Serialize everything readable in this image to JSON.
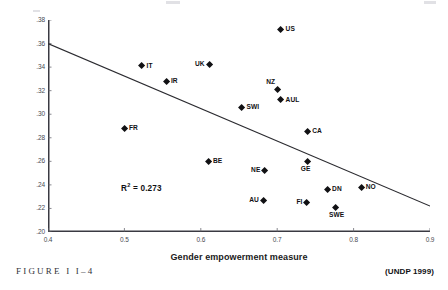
{
  "figure": {
    "caption": "FIGURE I I–4",
    "source_credit": "(UNDP 1999)"
  },
  "chart_data": {
    "type": "scatter",
    "title": "",
    "xlabel": "Gender empowerment measure",
    "ylabel": "Disposable income Gini",
    "xlim": [
      0.4,
      0.9
    ],
    "ylim": [
      0.2,
      0.38
    ],
    "xticks": [
      "0.4",
      "0.5",
      "0.6",
      "0.7",
      "0.8",
      "0.9"
    ],
    "xtick_values": [
      0.4,
      0.5,
      0.6,
      0.7,
      0.8,
      0.9
    ],
    "yticks": [
      ".38",
      ".36",
      ".34",
      ".32",
      ".30",
      ".28",
      ".26",
      ".24",
      ".22",
      ".20"
    ],
    "ytick_values": [
      0.38,
      0.36,
      0.34,
      0.32,
      0.3,
      0.28,
      0.26,
      0.24,
      0.22,
      0.2
    ],
    "grid": false,
    "legend": "none",
    "annotations": [
      {
        "text": "R² = 0.273",
        "r_squared": 0.273
      }
    ],
    "trendline": {
      "type": "linear",
      "x0": 0.4,
      "y0": 0.36,
      "x1": 0.9,
      "y1": 0.222,
      "color": "#2b2b30"
    },
    "points": [
      {
        "label": "US",
        "x": 0.705,
        "y": 0.372,
        "label_pos": "right"
      },
      {
        "label": "IT",
        "x": 0.523,
        "y": 0.341,
        "label_pos": "right"
      },
      {
        "label": "UK",
        "x": 0.611,
        "y": 0.342,
        "label_pos": "left"
      },
      {
        "label": "IR",
        "x": 0.555,
        "y": 0.328,
        "label_pos": "right"
      },
      {
        "label": "NZ",
        "x": 0.7,
        "y": 0.321,
        "label_pos": "ne"
      },
      {
        "label": "AUL",
        "x": 0.705,
        "y": 0.312,
        "label_pos": "right"
      },
      {
        "label": "SWI",
        "x": 0.654,
        "y": 0.306,
        "label_pos": "right"
      },
      {
        "label": "FR",
        "x": 0.5,
        "y": 0.288,
        "label_pos": "right"
      },
      {
        "label": "CA",
        "x": 0.74,
        "y": 0.285,
        "label_pos": "right"
      },
      {
        "label": "BE",
        "x": 0.61,
        "y": 0.26,
        "label_pos": "right"
      },
      {
        "label": "GE",
        "x": 0.74,
        "y": 0.26,
        "label_pos": "below"
      },
      {
        "label": "NE",
        "x": 0.684,
        "y": 0.252,
        "label_pos": "left"
      },
      {
        "label": "DN",
        "x": 0.766,
        "y": 0.236,
        "label_pos": "right"
      },
      {
        "label": "NO",
        "x": 0.81,
        "y": 0.238,
        "label_pos": "right"
      },
      {
        "label": "AU",
        "x": 0.682,
        "y": 0.227,
        "label_pos": "left"
      },
      {
        "label": "FI",
        "x": 0.739,
        "y": 0.225,
        "label_pos": "left"
      },
      {
        "label": "SWE",
        "x": 0.777,
        "y": 0.221,
        "label_pos": "below"
      }
    ]
  }
}
